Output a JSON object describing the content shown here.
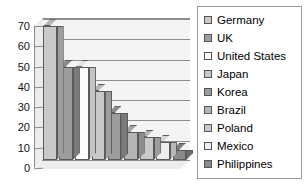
{
  "chart_data": {
    "type": "bar",
    "title": "",
    "subtitle": "",
    "xlabel": "",
    "ylabel": "",
    "ylim": [
      0,
      70
    ],
    "ytick_labels": [
      "70",
      "60",
      "50",
      "40",
      "30",
      "20",
      "10",
      "0"
    ],
    "ytick_values": [
      70,
      60,
      50,
      40,
      30,
      20,
      10,
      0
    ],
    "grid": true,
    "grid_axis": "y",
    "legend_position": "right",
    "three_d": true,
    "categories": [
      "Germany",
      "UK",
      "United States",
      "Japan",
      "Korea",
      "Brazil",
      "Poland",
      "Mexico",
      "Philippines"
    ],
    "values": [
      66,
      46,
      46,
      34,
      23,
      14,
      11.5,
      9,
      5
    ],
    "series": [
      {
        "name": "",
        "values": [
          66,
          46,
          46,
          34,
          23,
          14,
          11.5,
          9,
          5
        ]
      }
    ],
    "bar_colors": [
      "#c9c9c9",
      "#9d9d9d",
      "#fbfbfb",
      "#c9c9c9",
      "#9d9d9d",
      "#b5b5b5",
      "#c9c9c9",
      "#ededed",
      "#8a8a8a"
    ],
    "xtick_labels": []
  },
  "legend": {
    "items": [
      {
        "label": "Germany",
        "swatch": "#c9c9c9"
      },
      {
        "label": "UK",
        "swatch": "#9d9d9d"
      },
      {
        "label": "United States",
        "swatch": "#ffffff"
      },
      {
        "label": "Japan",
        "swatch": "#c9c9c9"
      },
      {
        "label": "Korea",
        "swatch": "#9d9d9d"
      },
      {
        "label": "Brazil",
        "swatch": "#b5b5b5"
      },
      {
        "label": "Poland",
        "swatch": "#c9c9c9"
      },
      {
        "label": "Mexico",
        "swatch": "#ededed"
      },
      {
        "label": "Philippines",
        "swatch": "#8a8a8a"
      }
    ]
  },
  "colors": {
    "background": "#ffffff",
    "axis": "#8c8c8c",
    "grid": "#8e8e8e",
    "plot_fill": "#f4f4f4",
    "text": "#111111",
    "legend_border": "#9a9a9a"
  }
}
